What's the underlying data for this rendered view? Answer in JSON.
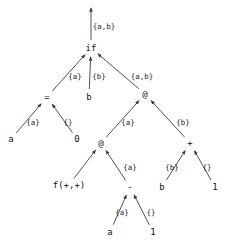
{
  "figure": {
    "kind": "directed-dataflow-graph",
    "background_color": "#ffffff",
    "edge_color": "#404040",
    "text_color": "#141414",
    "width": 235,
    "height": 248
  },
  "nodes": [
    {
      "id": "root-out",
      "label": "",
      "x": 91,
      "y": 7,
      "name": "root-arrow-head"
    },
    {
      "id": "if",
      "label": "if",
      "x": 91,
      "y": 48,
      "name": "node-if"
    },
    {
      "id": "eq",
      "label": "=",
      "x": 47,
      "y": 97,
      "name": "node-equals"
    },
    {
      "id": "b2",
      "label": "b",
      "x": 89,
      "y": 97,
      "name": "node-b-condition"
    },
    {
      "id": "at1",
      "label": "@",
      "x": 145,
      "y": 94,
      "name": "node-at-top"
    },
    {
      "id": "a1",
      "label": "a",
      "x": 11,
      "y": 139,
      "name": "node-a-left"
    },
    {
      "id": "zero",
      "label": "0",
      "x": 77,
      "y": 139,
      "name": "node-zero"
    },
    {
      "id": "at2",
      "label": "@",
      "x": 101,
      "y": 143,
      "name": "node-at-lower"
    },
    {
      "id": "plus",
      "label": "+",
      "x": 190,
      "y": 143,
      "name": "node-plus"
    },
    {
      "id": "fpp",
      "label": "f(+,+)",
      "x": 69,
      "y": 185,
      "name": "node-f-plus-plus"
    },
    {
      "id": "minus",
      "label": "-",
      "x": 130,
      "y": 187,
      "name": "node-minus"
    },
    {
      "id": "b3",
      "label": "b",
      "x": 162,
      "y": 187,
      "name": "node-b-plus-left"
    },
    {
      "id": "one1",
      "label": "1",
      "x": 215,
      "y": 187,
      "name": "node-one-right"
    },
    {
      "id": "a2",
      "label": "a",
      "x": 110,
      "y": 232,
      "name": "node-a-bottom"
    },
    {
      "id": "one2",
      "label": "1",
      "x": 153,
      "y": 232,
      "name": "node-one-bottom"
    }
  ],
  "edges": [
    {
      "from": "if",
      "to": "root-out",
      "label": "{a,b}",
      "label_x": 104,
      "label_y": 27,
      "name": "edge-if-to-output"
    },
    {
      "from": "eq",
      "to": "if",
      "label": "{a}",
      "label_x": 75,
      "label_y": 77,
      "name": "edge-equals-to-if"
    },
    {
      "from": "b2",
      "to": "if",
      "label": "{b}",
      "label_x": 99,
      "label_y": 77,
      "name": "edge-b-to-if"
    },
    {
      "from": "at1",
      "to": "if",
      "label": "{a,b}",
      "label_x": 142,
      "label_y": 77,
      "name": "edge-at-to-if"
    },
    {
      "from": "a1",
      "to": "eq",
      "label": "{a}",
      "label_x": 33,
      "label_y": 123,
      "name": "edge-a-to-equals"
    },
    {
      "from": "zero",
      "to": "eq",
      "label": "{}",
      "label_x": 68,
      "label_y": 123,
      "name": "edge-zero-to-equals"
    },
    {
      "from": "at2",
      "to": "at1",
      "label": "{a}",
      "label_x": 128,
      "label_y": 123,
      "name": "edge-at-lower-to-at-top"
    },
    {
      "from": "plus",
      "to": "at1",
      "label": "{b}",
      "label_x": 183,
      "label_y": 123,
      "name": "edge-plus-to-at-top"
    },
    {
      "from": "fpp",
      "to": "at2",
      "label": "",
      "label_x": 0,
      "label_y": 0,
      "name": "edge-f-to-at-lower"
    },
    {
      "from": "minus",
      "to": "at2",
      "label": "{a}",
      "label_x": 130,
      "label_y": 168,
      "name": "edge-minus-to-at-lower"
    },
    {
      "from": "b3",
      "to": "plus",
      "label": "{b}",
      "label_x": 172,
      "label_y": 168,
      "name": "edge-b-to-plus"
    },
    {
      "from": "one1",
      "to": "plus",
      "label": "{}",
      "label_x": 207,
      "label_y": 168,
      "name": "edge-one-to-plus"
    },
    {
      "from": "a2",
      "to": "minus",
      "label": "{a}",
      "label_x": 122,
      "label_y": 213,
      "name": "edge-a-to-minus"
    },
    {
      "from": "one2",
      "to": "minus",
      "label": "{}",
      "label_x": 151,
      "label_y": 213,
      "name": "edge-one-to-minus"
    }
  ]
}
